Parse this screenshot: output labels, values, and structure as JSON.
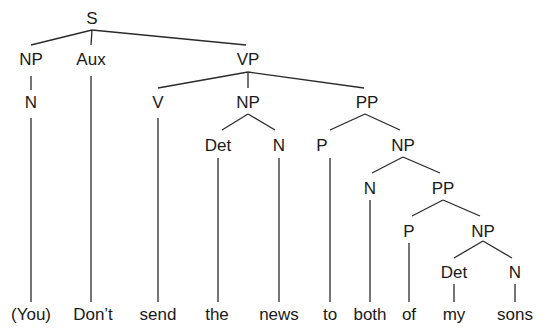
{
  "colors": {
    "background": "#ffffff",
    "ink": "#1a1a1a"
  },
  "nodes": [
    {
      "id": "S",
      "label": "S",
      "x": 92,
      "y": 24
    },
    {
      "id": "NP1",
      "label": "NP",
      "x": 31,
      "y": 65
    },
    {
      "id": "Aux",
      "label": "Aux",
      "x": 91,
      "y": 65
    },
    {
      "id": "VP",
      "label": "VP",
      "x": 248,
      "y": 65
    },
    {
      "id": "N1",
      "label": "N",
      "x": 31,
      "y": 108
    },
    {
      "id": "V",
      "label": "V",
      "x": 158,
      "y": 108
    },
    {
      "id": "NP2",
      "label": "NP",
      "x": 248,
      "y": 108
    },
    {
      "id": "PP1",
      "label": "PP",
      "x": 367,
      "y": 108
    },
    {
      "id": "Det1",
      "label": "Det",
      "x": 218,
      "y": 151
    },
    {
      "id": "N2",
      "label": "N",
      "x": 279,
      "y": 151
    },
    {
      "id": "P1",
      "label": "P",
      "x": 322,
      "y": 151
    },
    {
      "id": "NP3",
      "label": "NP",
      "x": 403,
      "y": 151
    },
    {
      "id": "N3",
      "label": "N",
      "x": 370,
      "y": 194
    },
    {
      "id": "PP2",
      "label": "PP",
      "x": 443,
      "y": 194
    },
    {
      "id": "P2",
      "label": "P",
      "x": 409,
      "y": 237
    },
    {
      "id": "NP4",
      "label": "NP",
      "x": 483,
      "y": 237
    },
    {
      "id": "Det2",
      "label": "Det",
      "x": 454,
      "y": 278
    },
    {
      "id": "N4",
      "label": "N",
      "x": 515,
      "y": 278
    }
  ],
  "words": [
    {
      "label": "(You)",
      "x": 31,
      "y": 320
    },
    {
      "label": "Don’t",
      "x": 93,
      "y": 320
    },
    {
      "label": "send",
      "x": 158,
      "y": 320
    },
    {
      "label": "the",
      "x": 217,
      "y": 320
    },
    {
      "label": "news",
      "x": 279,
      "y": 320
    },
    {
      "label": "to",
      "x": 330,
      "y": 320
    },
    {
      "label": "both",
      "x": 370,
      "y": 320
    },
    {
      "label": "of",
      "x": 409,
      "y": 320
    },
    {
      "label": "my",
      "x": 454,
      "y": 320
    },
    {
      "label": "sons",
      "x": 515,
      "y": 320
    }
  ],
  "edges": [
    [
      92,
      30,
      31,
      45
    ],
    [
      92,
      30,
      91,
      45
    ],
    [
      92,
      30,
      246,
      45
    ],
    [
      31,
      76,
      31,
      90
    ],
    [
      31,
      118,
      31,
      302
    ],
    [
      91,
      76,
      91,
      302
    ],
    [
      248,
      72,
      158,
      88
    ],
    [
      248,
      72,
      248,
      88
    ],
    [
      248,
      72,
      364,
      88
    ],
    [
      158,
      118,
      158,
      302
    ],
    [
      248,
      114,
      222,
      130
    ],
    [
      248,
      114,
      275,
      130
    ],
    [
      218,
      158,
      218,
      302
    ],
    [
      279,
      158,
      279,
      302
    ],
    [
      365,
      114,
      330,
      130
    ],
    [
      365,
      114,
      400,
      130
    ],
    [
      330,
      158,
      330,
      302
    ],
    [
      403,
      157,
      372,
      173
    ],
    [
      403,
      157,
      440,
      173
    ],
    [
      370,
      200,
      370,
      302
    ],
    [
      443,
      200,
      412,
      216
    ],
    [
      443,
      200,
      480,
      216
    ],
    [
      409,
      243,
      409,
      302
    ],
    [
      483,
      241,
      454,
      258
    ],
    [
      483,
      241,
      512,
      258
    ],
    [
      454,
      284,
      454,
      302
    ],
    [
      515,
      284,
      515,
      302
    ]
  ]
}
